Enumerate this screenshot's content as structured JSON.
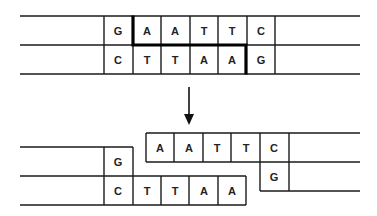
{
  "diagram": {
    "before": {
      "top_strand": [
        "G",
        "A",
        "A",
        "T",
        "T",
        "C"
      ],
      "bottom_strand": [
        "C",
        "T",
        "T",
        "A",
        "A",
        "G"
      ]
    },
    "arrow": "down-arrow",
    "after": {
      "left_fragment": {
        "top_strand": [
          "G"
        ],
        "bottom_strand": [
          "C",
          "T",
          "T",
          "A",
          "A"
        ]
      },
      "right_fragment": {
        "top_strand": [
          "A",
          "A",
          "T",
          "T",
          "C"
        ],
        "bottom_strand": [
          "G"
        ]
      }
    },
    "colors": {
      "line": "#1a1a1a",
      "cut": "#000000",
      "text": "#222222"
    }
  }
}
